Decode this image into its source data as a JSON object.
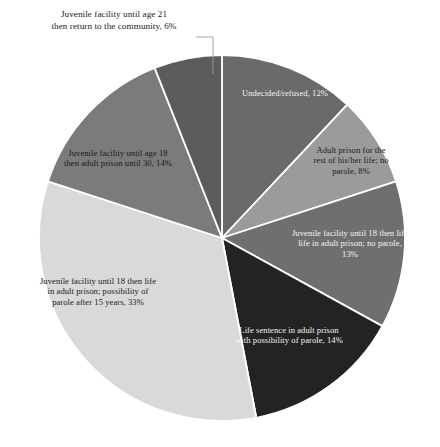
{
  "chart_data": {
    "type": "pie",
    "title": "",
    "subtitle": "",
    "xlabel": "",
    "ylabel": "",
    "grid": false,
    "legend_position": "none",
    "units": "percent",
    "total": 100,
    "categories": [
      "Undecided/refused",
      "Adult prison for the rest of his/her life; no parole",
      "Juvenile facility until 18 then life in adult prison; no parole",
      "Life sentence in adult prison with possibility of parole",
      "Juvenile facility until 18 then life in adult prison; possibility of parole after 15 years",
      "Juvenile facility until age 18 then adult prison until 30",
      "Juvenile facility until age 21 then return to the community"
    ],
    "values": [
      12,
      8,
      13,
      14,
      33,
      14,
      6
    ],
    "colors": [
      "#6a6a6a",
      "#9b9b9b",
      "#6f6f6f",
      "#232323",
      "#d9d9d9",
      "#7b7b7b",
      "#5c5c5c"
    ],
    "slices": [
      {
        "id": "undecided",
        "label": "Undecided/refused, 12%",
        "value": 12,
        "color": "#6a6a6a",
        "label_placement": "inside",
        "label_color": "light"
      },
      {
        "id": "adult-life-noparole",
        "label": "Adult prison for the\nrest of his/her life; no\nparole, 8%",
        "value": 8,
        "color": "#9b9b9b",
        "label_placement": "inside",
        "label_color": "dark"
      },
      {
        "id": "juv18-life-noparole",
        "label": "Juvenile facility until 18 then life\nlife in adult prison; no parole,\n13%",
        "value": 13,
        "color": "#6f6f6f",
        "label_placement": "inside",
        "label_color": "light"
      },
      {
        "id": "life-parole",
        "label": "Life sentence in adult prison\nwith possibility of parole, 14%",
        "value": 14,
        "color": "#232323",
        "label_placement": "inside",
        "label_color": "light"
      },
      {
        "id": "juv18-life-parole15",
        "label": "Juvenile facility until 18 then life\nin adult prison; possibility of\nparole after 15 years, 33%",
        "value": 33,
        "color": "#d9d9d9",
        "label_placement": "inside",
        "label_color": "dark"
      },
      {
        "id": "juv18-adult30",
        "label": "Juvenile facility until age 18\nthen adult prison until 30, 14%",
        "value": 14,
        "color": "#7b7b7b",
        "label_placement": "inside",
        "label_color": "dark"
      },
      {
        "id": "juv21-community",
        "label": "Juvenile facility until age 21\nthen return to the community, 6%",
        "value": 6,
        "color": "#5c5c5c",
        "label_placement": "outside",
        "label_color": "dark"
      }
    ]
  },
  "figure": {
    "background": "#ffffff",
    "slice_border_color": "#ffffff",
    "leader_line_color": "#9a9a9a",
    "center": {
      "x": 222,
      "y": 238
    },
    "radius": 183,
    "start_angle_deg": -90
  }
}
